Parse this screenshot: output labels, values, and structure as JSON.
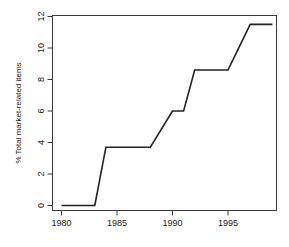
{
  "chart_data": {
    "type": "line",
    "title": "",
    "subtitle": "",
    "xlabel": "",
    "ylabel": "% Total market-related items",
    "xlim": [
      1979.2,
      1999.4
    ],
    "ylim": [
      0,
      12
    ],
    "grid": false,
    "legend": null,
    "x_ticks": [
      1980,
      1985,
      1990,
      1995
    ],
    "x_tick_labels": [
      "1980",
      "1985",
      "1990",
      "1995"
    ],
    "y_ticks": [
      0,
      2,
      4,
      6,
      8,
      10,
      12
    ],
    "y_tick_labels": [
      "0",
      "2",
      "4",
      "6",
      "8",
      "10",
      "12"
    ],
    "line_color": "#222222",
    "line_width": 1.6,
    "x": [
      1980,
      1983,
      1984,
      1988,
      1990,
      1991,
      1992,
      1995,
      1997,
      1999
    ],
    "values": [
      0,
      0,
      3.7,
      3.7,
      6.0,
      6.0,
      8.6,
      8.6,
      11.5,
      11.5
    ],
    "series": [
      {
        "name": "% Total market-related items",
        "x": [
          1980,
          1983,
          1984,
          1988,
          1990,
          1991,
          1992,
          1995,
          1997,
          1999
        ],
        "values": [
          0,
          0,
          3.7,
          3.7,
          6.0,
          6.0,
          8.6,
          8.6,
          11.5,
          11.5
        ]
      }
    ],
    "annotations": []
  },
  "figure": {
    "background_color": "#ffffff",
    "axis_color": "#3a3a3a"
  }
}
